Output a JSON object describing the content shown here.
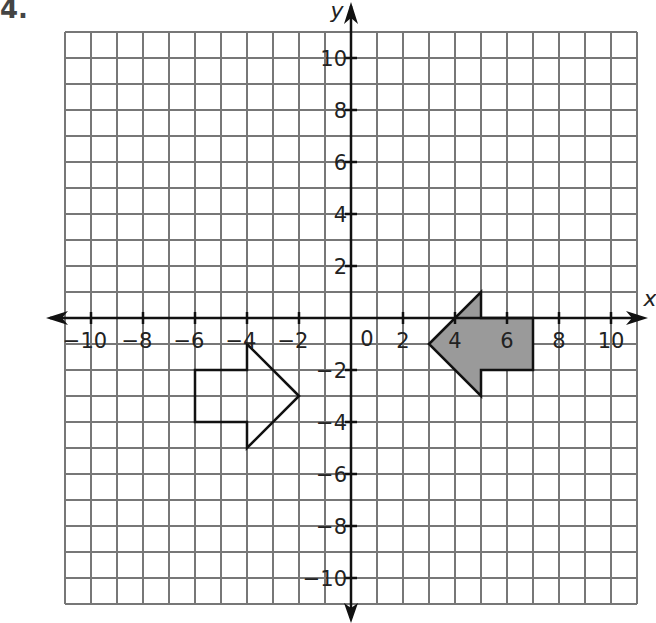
{
  "problem": {
    "number": "4."
  },
  "chart_data": {
    "type": "coordinate-plane",
    "title": "",
    "xlabel": "x",
    "ylabel": "y",
    "xlim": [
      -11,
      11
    ],
    "ylim": [
      -11,
      11
    ],
    "grid": true,
    "x_tick_labels": [
      "-10",
      "-8",
      "-6",
      "-4",
      "-2",
      "0",
      "2",
      "4",
      "6",
      "8",
      "10"
    ],
    "y_tick_labels": [
      "10",
      "8",
      "6",
      "4",
      "2",
      "-2",
      "-4",
      "-6",
      "-8",
      "-10"
    ],
    "origin_label": "0",
    "shapes": [
      {
        "name": "shaded-left-arrow",
        "fill": "#9a9a9a",
        "stroke": "#111111",
        "points": [
          [
            3,
            -1
          ],
          [
            5,
            1
          ],
          [
            5,
            0
          ],
          [
            7,
            0
          ],
          [
            7,
            -2
          ],
          [
            5,
            -2
          ],
          [
            5,
            -3
          ]
        ]
      },
      {
        "name": "outline-right-arrow",
        "fill": "none",
        "stroke": "#111111",
        "points": [
          [
            -2,
            -3
          ],
          [
            -4,
            -1
          ],
          [
            -4,
            -2
          ],
          [
            -6,
            -2
          ],
          [
            -6,
            -4
          ],
          [
            -4,
            -4
          ],
          [
            -4,
            -5
          ]
        ]
      }
    ]
  }
}
